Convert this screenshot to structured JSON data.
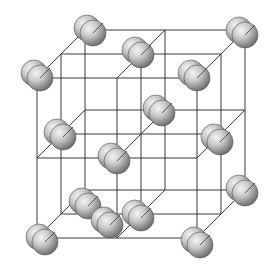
{
  "diagram": {
    "type": "crystal-lattice",
    "colors": {
      "background": "#ffffff",
      "line": "#3a3a3a",
      "atom_light": "#f2f2f2",
      "atom_mid": "#bdbdbd",
      "atom_dark": "#6f6f6f",
      "atom_outline": "#555555"
    },
    "front_face": {
      "x0": 37,
      "y0": 78,
      "size": 160
    },
    "depth_offset": {
      "dx": 48,
      "dy": -48
    },
    "atom_radius": 13,
    "pair_offset": {
      "dx": -6,
      "dy": -5
    },
    "atoms": [
      {
        "name": "back-top-left",
        "x": 93,
        "y": 33
      },
      {
        "name": "back-top-right",
        "x": 245,
        "y": 35
      },
      {
        "name": "front-top-left",
        "x": 40,
        "y": 78
      },
      {
        "name": "top-face-center",
        "x": 141,
        "y": 55
      },
      {
        "name": "front-top-right",
        "x": 197,
        "y": 78
      },
      {
        "name": "back-right-mid",
        "x": 162,
        "y": 113
      },
      {
        "name": "left-face-center",
        "x": 63,
        "y": 137
      },
      {
        "name": "body-center",
        "x": 117,
        "y": 161
      },
      {
        "name": "right-face-center",
        "x": 220,
        "y": 142
      },
      {
        "name": "back-left-lower",
        "x": 88,
        "y": 206
      },
      {
        "name": "front-bottom-left",
        "x": 45,
        "y": 242
      },
      {
        "name": "bottom-face-center",
        "x": 141,
        "y": 218
      },
      {
        "name": "back-bottom-right",
        "x": 245,
        "y": 193
      },
      {
        "name": "front-bottom-right",
        "x": 200,
        "y": 245
      },
      {
        "name": "front-face-center",
        "x": 110,
        "y": 225
      }
    ]
  }
}
